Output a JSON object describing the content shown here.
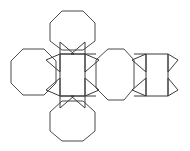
{
  "figure": {
    "canvas": {
      "width": 190,
      "height": 151
    },
    "style": {
      "background_color": "#ffffff",
      "stroke_color": "#3a3a3f",
      "octagon_stroke_color": "#4a4a50",
      "stroke_width": 1,
      "fill": "none"
    },
    "counts": {
      "octagons": 4,
      "squares": 2,
      "triangles": 12
    },
    "shapes": [
      {
        "name": "octagon-top",
        "kind": "octagon",
        "points": "62,11 83,11 95,23 95,41 83,50 62,50 50,41 50,23"
      },
      {
        "name": "octagon-left",
        "kind": "octagon",
        "points": "23,49 44,49 56,61 56,83 44,95 23,95 11,83 11,61"
      },
      {
        "name": "octagon-bottom",
        "kind": "octagon",
        "points": "62,101 83,101 95,112 95,131 83,141 62,141 50,131 50,112"
      },
      {
        "name": "octagon-middle-right",
        "kind": "octagon",
        "points": "108,49 124,49 134,60 134,88 124,100 108,100 96,88 96,60"
      },
      {
        "name": "square-center",
        "kind": "square",
        "points": "60,54 85,54 85,96 60,96"
      },
      {
        "name": "square-right",
        "kind": "square",
        "points": "146,54 168,54 168,96 146,96"
      },
      {
        "name": "triangle-center-top-left",
        "kind": "triangle",
        "points": "60,54 60,72 46,60"
      },
      {
        "name": "triangle-center-top-right",
        "kind": "triangle",
        "points": "85,54 85,72 99,60"
      },
      {
        "name": "triangle-center-bottom-left",
        "kind": "triangle",
        "points": "60,96 60,78 46,90"
      },
      {
        "name": "triangle-center-bottom-right",
        "kind": "triangle",
        "points": "85,96 85,78 99,90"
      },
      {
        "name": "triangle-center-top-left-upper",
        "kind": "triangle",
        "points": "60,54 74,54 60,42"
      },
      {
        "name": "triangle-center-top-right-upper",
        "kind": "triangle",
        "points": "85,54 71,54 85,42"
      },
      {
        "name": "triangle-center-bottom-left-lower",
        "kind": "triangle",
        "points": "60,96 74,96 60,108"
      },
      {
        "name": "triangle-center-bottom-right-lower",
        "kind": "triangle",
        "points": "85,96 71,96 85,108"
      },
      {
        "name": "triangle-right-top-left",
        "kind": "triangle",
        "points": "146,54 146,72 132,60"
      },
      {
        "name": "triangle-right-top-right",
        "kind": "triangle",
        "points": "168,54 168,72 178,60"
      },
      {
        "name": "triangle-right-bottom-left",
        "kind": "triangle",
        "points": "146,96 146,78 132,90"
      },
      {
        "name": "triangle-right-bottom-right",
        "kind": "triangle",
        "points": "168,96 168,78 178,90"
      }
    ],
    "connectors": [
      {
        "name": "connector-top-square-to-octagon",
        "points": "85,54 96,54"
      },
      {
        "name": "connector-bottom-square-to-octagon",
        "points": "85,96 96,96"
      },
      {
        "name": "connector-mid-octagon-to-right-square",
        "points": "134,54 146,54"
      },
      {
        "name": "connector-mid-octagon-to-right-square-bottom",
        "points": "134,96 146,96"
      }
    ]
  }
}
